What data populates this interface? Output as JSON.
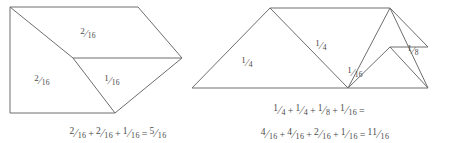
{
  "page": {
    "background_color": "#ffffff",
    "line_color": "#6e6e6e",
    "text_color": "#4a4a4a"
  },
  "figures": [
    {
      "id": "left-figure",
      "name": "left-pentagon-figure",
      "piece_labels": [
        {
          "name": "label-left-top",
          "numerator": "2",
          "denominator": "16",
          "x": 88,
          "y": 33
        },
        {
          "name": "label-left-lower-left",
          "numerator": "2",
          "denominator": "16",
          "x": 42,
          "y": 80
        },
        {
          "name": "label-left-lower-right",
          "numerator": "1",
          "denominator": "16",
          "x": 112,
          "y": 80
        }
      ],
      "equations": [
        {
          "name": "left-equation",
          "x": 118,
          "y": 126,
          "terms": [
            {
              "numerator": "2",
              "denominator": "16"
            },
            {
              "op": "+"
            },
            {
              "numerator": "2",
              "denominator": "16"
            },
            {
              "op": "+"
            },
            {
              "numerator": "1",
              "denominator": "16"
            },
            {
              "op": "="
            },
            {
              "numerator": "5",
              "denominator": "16"
            }
          ]
        }
      ]
    },
    {
      "id": "right-figure",
      "name": "right-tangram-figure",
      "piece_labels": [
        {
          "name": "label-right-big-left",
          "numerator": "1",
          "denominator": "4",
          "x": 247,
          "y": 62
        },
        {
          "name": "label-right-big-middle",
          "numerator": "1",
          "denominator": "4",
          "x": 321,
          "y": 45
        },
        {
          "name": "label-right-small-triangle",
          "numerator": "1",
          "denominator": "16",
          "x": 355,
          "y": 72
        },
        {
          "name": "label-right-square",
          "numerator": "1",
          "denominator": "8",
          "x": 413,
          "y": 50
        }
      ],
      "equations": [
        {
          "name": "right-equation-quarters",
          "x": 320,
          "y": 103,
          "terms": [
            {
              "numerator": "1",
              "denominator": "4"
            },
            {
              "op": "+"
            },
            {
              "numerator": "1",
              "denominator": "4"
            },
            {
              "op": "+"
            },
            {
              "numerator": "1",
              "denominator": "8"
            },
            {
              "op": "+"
            },
            {
              "numerator": "1",
              "denominator": "16"
            },
            {
              "op": "="
            }
          ]
        },
        {
          "name": "right-equation-sixteenths",
          "x": 325,
          "y": 127,
          "terms": [
            {
              "numerator": "4",
              "denominator": "16"
            },
            {
              "op": "+"
            },
            {
              "numerator": "4",
              "denominator": "16"
            },
            {
              "op": "+"
            },
            {
              "numerator": "2",
              "denominator": "16"
            },
            {
              "op": "+"
            },
            {
              "numerator": "1",
              "denominator": "16"
            },
            {
              "op": "="
            },
            {
              "numerator": "11",
              "denominator": "16"
            }
          ]
        }
      ]
    }
  ],
  "geometry": {
    "left_outline": "M 10 7 L 138 7 L 182 58 L 115 113 L 10 113 Z",
    "left_diagonal_upper": "M 10 7 L 73 58",
    "left_midline": "M 73 58 L 182 58",
    "left_diagonal_lower": "M 73 58 L 115 113",
    "right_outline": "M 192 88 L 270 8 L 390 8 L 428 88 Z",
    "right_inner_v": "M 270 8 L 348 88 L 390 8",
    "right_square_top": "M 390 8 L 428 47",
    "right_square_side": "M 390 47 L 428 47",
    "right_square_lower_left": "M 390 47 L 428 88",
    "right_square_diag": "M 348 88 L 390 47"
  }
}
